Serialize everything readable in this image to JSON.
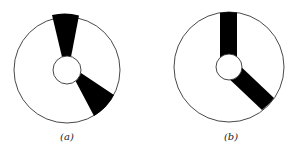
{
  "figures": [
    {
      "id": "a",
      "caption": "(a)",
      "shape": "disk with two tapered black wedges",
      "outer_circle": {
        "cx": 67,
        "cy": 70,
        "r": 53
      },
      "inner_circle": {
        "cx": 67,
        "cy": 70,
        "r": 14
      }
    },
    {
      "id": "b",
      "caption": "(b)",
      "shape": "disk with two parallel-sided black bars",
      "outer_circle": {
        "cx": 229,
        "cy": 67,
        "r": 55
      },
      "inner_circle": {
        "cx": 229,
        "cy": 67,
        "r": 13
      }
    }
  ],
  "colors": {
    "fill": "#000000",
    "stroke": "#333333",
    "background": "#ffffff"
  }
}
